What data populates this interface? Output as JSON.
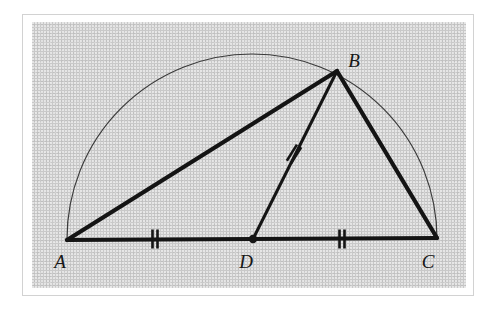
{
  "figure": {
    "caption": "",
    "background_color": "#c9c9c9",
    "ink_color": "#141414",
    "arc_color": "#3a3a3a",
    "frame_color": "#d2d2d2",
    "page_color": "#ffffff"
  },
  "points": {
    "A": {
      "label": "A",
      "x": 35,
      "y": 218,
      "label_x": 28,
      "label_y": 246
    },
    "B": {
      "label": "B",
      "x": 305,
      "y": 49,
      "label_x": 322,
      "label_y": 45
    },
    "C": {
      "label": "C",
      "x": 405,
      "y": 216,
      "label_x": 396,
      "label_y": 246
    },
    "D": {
      "label": "D",
      "x": 221,
      "y": 217,
      "label_x": 214,
      "label_y": 246
    }
  },
  "segments": [
    {
      "name": "AB",
      "from": "A",
      "to": "B",
      "stroke_width": 4.2
    },
    {
      "name": "BC",
      "from": "B",
      "to": "C",
      "stroke_width": 4.2
    },
    {
      "name": "AC",
      "from": "A",
      "to": "C",
      "stroke_width": 4.2
    },
    {
      "name": "BD",
      "from": "B",
      "to": "D",
      "stroke_width": 3.0
    }
  ],
  "arc": {
    "name": "semicircle-on-AC",
    "center_x": 220,
    "center_y": 217,
    "radius": 185,
    "stroke_width": 1.2
  },
  "tick_marks": [
    {
      "name": "tick-AD",
      "segment": "AD",
      "count": 2,
      "x": 123,
      "y": 217,
      "angle": 0
    },
    {
      "name": "tick-DC",
      "segment": "DC",
      "count": 2,
      "x": 310,
      "y": 217,
      "angle": 0
    },
    {
      "name": "tick-BD",
      "segment": "BD",
      "count": 2,
      "x": 262,
      "y": 132,
      "angle": 32
    }
  ],
  "vertex_dot": {
    "name": "point-D-dot",
    "x": 221,
    "y": 217,
    "radius": 4.2
  }
}
